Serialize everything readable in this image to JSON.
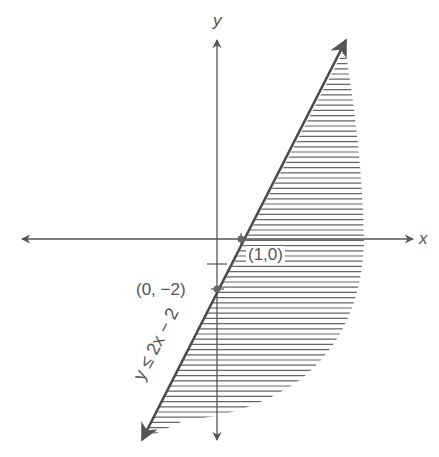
{
  "chart_data": {
    "type": "line",
    "title": "",
    "xlabel": "x",
    "ylabel": "y",
    "series": [
      {
        "name": "y ≤ 2x − 2",
        "equation": "y = 2x - 2",
        "x": [
          -3,
          5
        ],
        "y": [
          -8,
          8
        ],
        "shaded": "below-right (y ≤ 2x − 2)"
      }
    ],
    "points": [
      {
        "label": "(1,0)",
        "x": 1,
        "y": 0
      },
      {
        "label": "(0, −2)",
        "x": 0,
        "y": -2
      }
    ],
    "annotations": [
      "y ≤ 2x − 2"
    ],
    "grid": false
  },
  "labels": {
    "x_axis": "x",
    "y_axis": "y",
    "point1": "(1,0)",
    "point2": "(0, −2)",
    "inequality": "y ≤ 2x − 2"
  },
  "colors": {
    "ink": "#555555",
    "hatch": "#666666"
  }
}
